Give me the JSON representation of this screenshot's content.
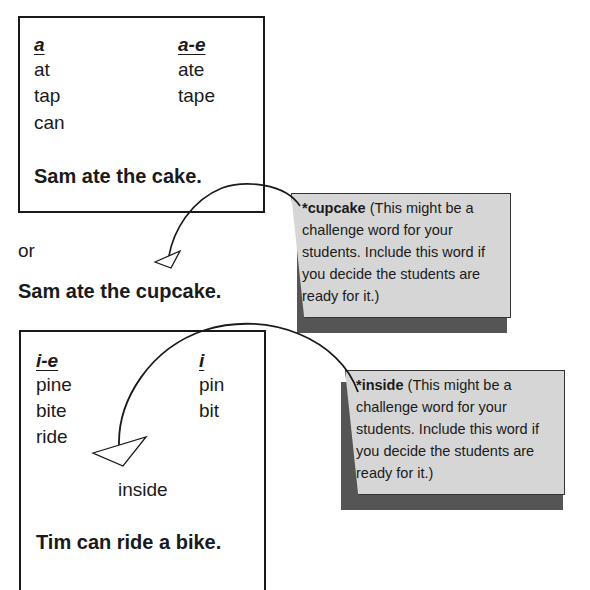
{
  "box1": {
    "col1_header": "a",
    "col1_words": [
      "at",
      "tap",
      "can"
    ],
    "col2_header": "a-e",
    "col2_words": [
      "ate",
      "tape"
    ],
    "sentence": "Sam ate the cake."
  },
  "or_label": "or",
  "alt_sentence": "Sam ate the cupcake.",
  "note1": {
    "word": "*cupcake",
    "text_lines": [
      "(This might be a",
      "challenge word for your",
      "students. Include this word if",
      "you decide the students are",
      "ready for it.)"
    ]
  },
  "box2": {
    "col1_header": "i-e",
    "col1_words": [
      "pine",
      "bite",
      "ride"
    ],
    "col2_header": "i",
    "col2_words": [
      "pin",
      "bit"
    ],
    "inserted_word": "inside",
    "sentence": "Tim can ride a bike."
  },
  "note2": {
    "word": "*inside",
    "text_lines": [
      "(This might be a",
      "challenge word for your",
      "students. Include this word if",
      "you decide the students are",
      "ready for it.)"
    ]
  }
}
